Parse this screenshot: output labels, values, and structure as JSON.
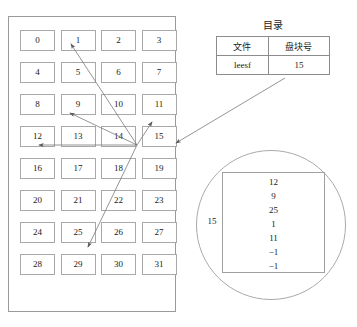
{
  "disk": {
    "panel_name": "disk-block-grid",
    "columns": 4,
    "rows": 8,
    "blocks": [
      "0",
      "1",
      "2",
      "3",
      "4",
      "5",
      "6",
      "7",
      "8",
      "9",
      "10",
      "11",
      "12",
      "13",
      "14",
      "15",
      "16",
      "17",
      "18",
      "19",
      "20",
      "21",
      "22",
      "23",
      "24",
      "25",
      "26",
      "27",
      "28",
      "29",
      "30",
      "31"
    ]
  },
  "directory": {
    "title": "目录",
    "headers": [
      "文件",
      "盘块号"
    ],
    "rows": [
      {
        "file": "leesf",
        "block": "15"
      }
    ]
  },
  "index_block": {
    "block_label": "15",
    "entries": [
      "12",
      "9",
      "25",
      "1",
      "11",
      "−1",
      "−1"
    ]
  },
  "arrows": {
    "source_block": "15",
    "targets": [
      "1",
      "9",
      "11",
      "12",
      "25"
    ],
    "from_directory_to_block": "15"
  },
  "colors": {
    "line": "#9a9a9a",
    "cell_border": "#a8a8a8",
    "text": "#1a1a1a",
    "arrow": "#6f6f6f",
    "background": "#ffffff"
  }
}
